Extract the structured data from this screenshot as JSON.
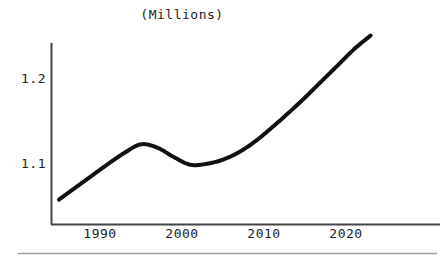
{
  "chart_data": {
    "type": "line",
    "title": "(Millions)",
    "xlabel": "",
    "ylabel": "",
    "grid": false,
    "legend": null,
    "xlim": [
      1985,
      2023
    ],
    "ylim": [
      1.048,
      1.256
    ],
    "xticks": [
      "1990",
      "2000",
      "2010",
      "2020"
    ],
    "xtick_values": [
      1990,
      2000,
      2010,
      2020
    ],
    "yticks": [
      "1.1",
      "1.2"
    ],
    "ytick_values": [
      1.1,
      1.2
    ],
    "line_color": "#111111",
    "line_width": 4,
    "series": [
      {
        "name": "Population",
        "x": [
          1985,
          1987,
          1989,
          1991,
          1993,
          1995,
          1997,
          1999,
          2001,
          2003,
          2005,
          2007,
          2009,
          2011,
          2013,
          2015,
          2017,
          2019,
          2021,
          2023
        ],
        "values": [
          1.057,
          1.071,
          1.085,
          1.099,
          1.112,
          1.122,
          1.118,
          1.107,
          1.098,
          1.099,
          1.104,
          1.113,
          1.126,
          1.142,
          1.159,
          1.177,
          1.196,
          1.215,
          1.234,
          1.25
        ]
      }
    ],
    "annotations": []
  },
  "axes": {
    "y_axis_name": "y-axis-line",
    "x_axis_name": "x-axis-line"
  },
  "footer": {
    "separator": "horizontal-rule"
  }
}
